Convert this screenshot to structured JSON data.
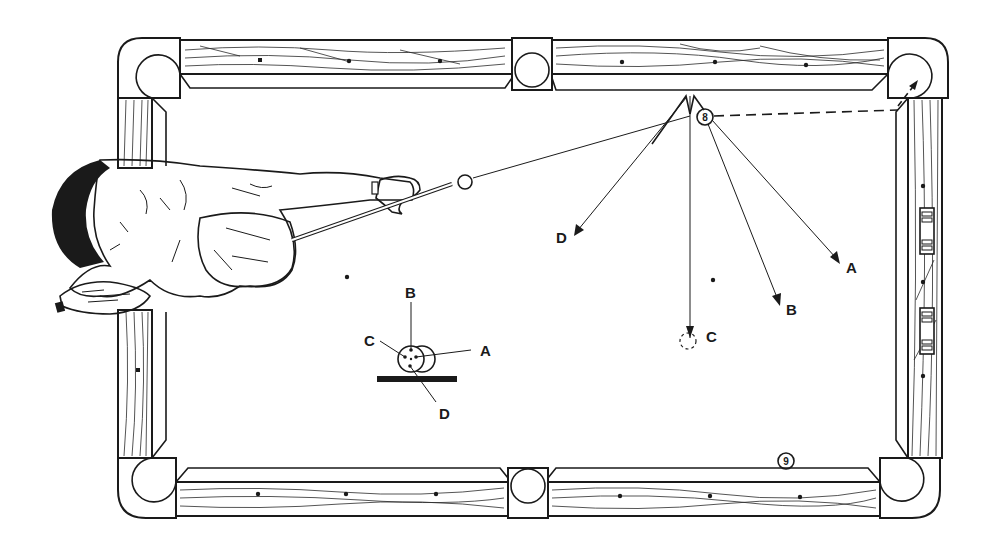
{
  "diagram": {
    "colors": {
      "ink": "#1a1a1a",
      "background": "#ffffff"
    },
    "balls": {
      "cue_ball_label": "",
      "object_ball_8": "8",
      "ball_9": "9"
    },
    "paths": {
      "path_a": "A",
      "path_b": "B",
      "path_c": "C",
      "path_d": "D"
    },
    "cue_tip_inset": {
      "point_a": "A",
      "point_b": "B",
      "point_c": "C",
      "point_d": "D"
    }
  }
}
